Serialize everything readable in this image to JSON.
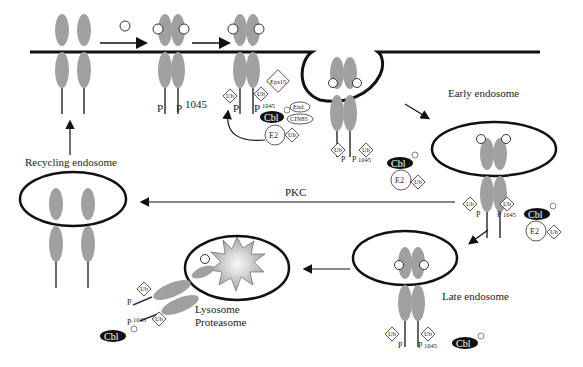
{
  "diagram": {
    "type": "receptor endocytosis and trafficking pathway",
    "labels": {
      "early_endosome": "Early endosome",
      "recycling_endosome": "Recycling endosome",
      "late_endosome": "Late endosome",
      "lysosome": "Lysosome",
      "proteasome": "Proteasome",
      "pkc": "PKC"
    },
    "proteins": {
      "cbl": "Cbl",
      "e2": "E2",
      "ub": "Ub",
      "eps15": "Eps15",
      "end": "End",
      "cin85": "CIN85",
      "phospho": "P",
      "p_site": "P",
      "site_number": "1045"
    },
    "colors": {
      "receptor": "#a0a0a0",
      "membrane": "#111111",
      "cbl_fill": "#111111",
      "degradation_burst": "#c8c8c8"
    }
  }
}
